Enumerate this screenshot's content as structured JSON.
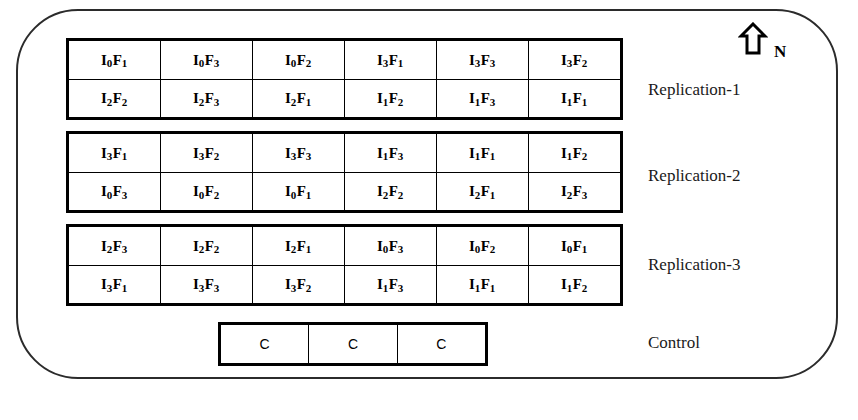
{
  "diagram": {
    "north_indicator": {
      "icon": "north-arrow-icon",
      "label": "N"
    },
    "treatment_notation": {
      "irrigation_symbol": "I",
      "fertilizer_symbol": "F"
    },
    "replications": [
      {
        "name": "Replication-1",
        "rows": [
          [
            {
              "main": "I",
              "sub1": "0",
              "factor": "F",
              "sub2": "1"
            },
            {
              "main": "I",
              "sub1": "0",
              "factor": "F",
              "sub2": "3"
            },
            {
              "main": "I",
              "sub1": "0",
              "factor": "F",
              "sub2": "2"
            },
            {
              "main": "I",
              "sub1": "3",
              "factor": "F",
              "sub2": "1"
            },
            {
              "main": "I",
              "sub1": "3",
              "factor": "F",
              "sub2": "3"
            },
            {
              "main": "I",
              "sub1": "3",
              "factor": "F",
              "sub2": "2"
            }
          ],
          [
            {
              "main": "I",
              "sub1": "2",
              "factor": "F",
              "sub2": "2"
            },
            {
              "main": "I",
              "sub1": "2",
              "factor": "F",
              "sub2": "3"
            },
            {
              "main": "I",
              "sub1": "2",
              "factor": "F",
              "sub2": "1"
            },
            {
              "main": "I",
              "sub1": "1",
              "factor": "F",
              "sub2": "2"
            },
            {
              "main": "I",
              "sub1": "1",
              "factor": "F",
              "sub2": "3"
            },
            {
              "main": "I",
              "sub1": "1",
              "factor": "F",
              "sub2": "1"
            }
          ]
        ]
      },
      {
        "name": "Replication-2",
        "rows": [
          [
            {
              "main": "I",
              "sub1": "3",
              "factor": "F",
              "sub2": "1"
            },
            {
              "main": "I",
              "sub1": "3",
              "factor": "F",
              "sub2": "2"
            },
            {
              "main": "I",
              "sub1": "3",
              "factor": "F",
              "sub2": "3"
            },
            {
              "main": "I",
              "sub1": "1",
              "factor": "F",
              "sub2": "3"
            },
            {
              "main": "I",
              "sub1": "1",
              "factor": "F",
              "sub2": "1"
            },
            {
              "main": "I",
              "sub1": "1",
              "factor": "F",
              "sub2": "2"
            }
          ],
          [
            {
              "main": "I",
              "sub1": "0",
              "factor": "F",
              "sub2": "3"
            },
            {
              "main": "I",
              "sub1": "0",
              "factor": "F",
              "sub2": "2"
            },
            {
              "main": "I",
              "sub1": "0",
              "factor": "F",
              "sub2": "1"
            },
            {
              "main": "I",
              "sub1": "2",
              "factor": "F",
              "sub2": "2"
            },
            {
              "main": "I",
              "sub1": "2",
              "factor": "F",
              "sub2": "1"
            },
            {
              "main": "I",
              "sub1": "2",
              "factor": "F",
              "sub2": "3"
            }
          ]
        ]
      },
      {
        "name": "Replication-3",
        "rows": [
          [
            {
              "main": "I",
              "sub1": "2",
              "factor": "F",
              "sub2": "3"
            },
            {
              "main": "I",
              "sub1": "2",
              "factor": "F",
              "sub2": "2"
            },
            {
              "main": "I",
              "sub1": "2",
              "factor": "F",
              "sub2": "1"
            },
            {
              "main": "I",
              "sub1": "0",
              "factor": "F",
              "sub2": "3"
            },
            {
              "main": "I",
              "sub1": "0",
              "factor": "F",
              "sub2": "2"
            },
            {
              "main": "I",
              "sub1": "0",
              "factor": "F",
              "sub2": "1"
            }
          ],
          [
            {
              "main": "I",
              "sub1": "3",
              "factor": "F",
              "sub2": "1"
            },
            {
              "main": "I",
              "sub1": "3",
              "factor": "F",
              "sub2": "3"
            },
            {
              "main": "I",
              "sub1": "3",
              "factor": "F",
              "sub2": "2"
            },
            {
              "main": "I",
              "sub1": "1",
              "factor": "F",
              "sub2": "3"
            },
            {
              "main": "I",
              "sub1": "1",
              "factor": "F",
              "sub2": "1"
            },
            {
              "main": "I",
              "sub1": "1",
              "factor": "F",
              "sub2": "2"
            }
          ]
        ]
      }
    ],
    "control": {
      "name": "Control",
      "cells": [
        "C",
        "C",
        "C"
      ]
    },
    "side_labels": [
      "Replication-1",
      "Replication-2",
      "Replication-3",
      "Control"
    ],
    "colors": {
      "line": "#000000",
      "boundary": "#2b2b2b",
      "background": "#ffffff",
      "text": "#000000"
    }
  }
}
